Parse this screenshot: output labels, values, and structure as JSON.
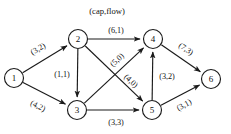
{
  "caption": {
    "text": "(cap,flow)",
    "x": 107,
    "y": 11
  },
  "chart_data": {
    "type": "diagram",
    "title": "(cap,flow)",
    "subtitle": "",
    "xlabel": "",
    "ylabel": "",
    "diagram_kind": "directed-flow-network",
    "edge_label_format": "(capacity,flow)",
    "nodes": [
      {
        "id": "1",
        "label": "1",
        "x": 14,
        "y": 78,
        "r": 9.5
      },
      {
        "id": "2",
        "label": "2",
        "x": 78,
        "y": 39,
        "r": 9.5
      },
      {
        "id": "3",
        "label": "3",
        "x": 77,
        "y": 110,
        "r": 9.5
      },
      {
        "id": "4",
        "label": "4",
        "x": 153,
        "y": 39,
        "r": 9.5
      },
      {
        "id": "5",
        "label": "5",
        "x": 152,
        "y": 110,
        "r": 9.5
      },
      {
        "id": "6",
        "label": "6",
        "x": 211,
        "y": 79,
        "r": 9.5
      }
    ],
    "edges": [
      {
        "from": "1",
        "to": "2",
        "label": "(3,2)",
        "capacity": 3,
        "flow": 2,
        "lx": 38,
        "ly": 49,
        "rot": -31
      },
      {
        "from": "1",
        "to": "3",
        "label": "(4,2)",
        "capacity": 4,
        "flow": 2,
        "lx": 38,
        "ly": 106,
        "rot": 26
      },
      {
        "from": "2",
        "to": "3",
        "label": "(1,1)",
        "capacity": 1,
        "flow": 1,
        "lx": 62,
        "ly": 74,
        "rot": 0
      },
      {
        "from": "2",
        "to": "4",
        "label": "(6,1)",
        "capacity": 6,
        "flow": 1,
        "lx": 116,
        "ly": 30,
        "rot": 0
      },
      {
        "from": "2",
        "to": "5",
        "label": "(4,0)",
        "capacity": 4,
        "flow": 0,
        "lx": 131,
        "ly": 81,
        "rot": 43
      },
      {
        "from": "3",
        "to": "4",
        "label": "(5,0)",
        "capacity": 5,
        "flow": 0,
        "lx": 117,
        "ly": 60,
        "rot": -43
      },
      {
        "from": "3",
        "to": "5",
        "label": "(3,3)",
        "capacity": 3,
        "flow": 3,
        "lx": 116,
        "ly": 122,
        "rot": 0
      },
      {
        "from": "5",
        "to": "4",
        "label": "(3,2)",
        "capacity": 3,
        "flow": 2,
        "lx": 167,
        "ly": 76,
        "rot": 0
      },
      {
        "from": "4",
        "to": "6",
        "label": "(7,3)",
        "capacity": 7,
        "flow": 3,
        "lx": 186,
        "ly": 49,
        "rot": 34
      },
      {
        "from": "5",
        "to": "6",
        "label": "(3,1)",
        "capacity": 3,
        "flow": 1,
        "lx": 184,
        "ly": 105,
        "rot": -30
      }
    ],
    "legend": [
      "(cap,flow)"
    ],
    "grid": false
  }
}
